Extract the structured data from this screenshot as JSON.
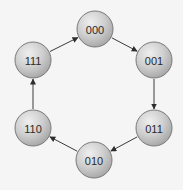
{
  "diagram": {
    "type": "state-cycle",
    "background": "#f5f5f5",
    "node_fill_light": "#ececec",
    "node_fill_dark": "#a8a8a8",
    "node_stroke": "#7a7a7a",
    "edge_color": "#3a3a3a",
    "node_radius": 18,
    "nodes": [
      {
        "id": "n000",
        "label": "000",
        "cx": 95,
        "cy": 29
      },
      {
        "id": "n001",
        "label": "001",
        "cx": 154,
        "cy": 60
      },
      {
        "id": "n011",
        "label": "011",
        "cx": 154,
        "cy": 128
      },
      {
        "id": "n010",
        "label": "010",
        "cx": 94,
        "cy": 160
      },
      {
        "id": "n110",
        "label": "110",
        "cx": 33,
        "cy": 128
      },
      {
        "id": "n111",
        "label": "111",
        "cx": 33,
        "cy": 60
      }
    ],
    "edges": [
      {
        "from": "000",
        "to": "001"
      },
      {
        "from": "001",
        "to": "011"
      },
      {
        "from": "011",
        "to": "010"
      },
      {
        "from": "010",
        "to": "110"
      },
      {
        "from": "110",
        "to": "111"
      },
      {
        "from": "111",
        "to": "000"
      }
    ]
  }
}
